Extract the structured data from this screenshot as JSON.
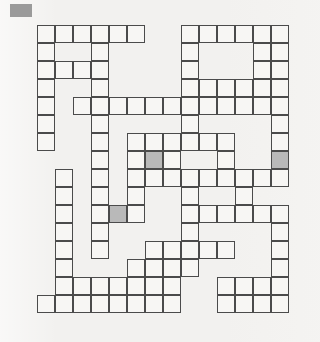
{
  "page": {
    "kind": "crossword-grid-diagram",
    "background_color": "#f2f1ef",
    "width": 320,
    "height": 342
  },
  "corner_swatch": {
    "label": "",
    "color": "#9a9a9a",
    "x": 10,
    "y": 4,
    "width": 22,
    "height": 13
  },
  "grid": {
    "origin_x": 37,
    "origin_y": 25,
    "cell_size": 18,
    "columns": 14,
    "rows": 16,
    "line_color": "#4b4b4b",
    "cell_color": "#f7f6f4",
    "shaded_color": "#b9b9b9",
    "shaded_cells": [
      [
        7,
        6
      ],
      [
        7,
        13
      ],
      [
        10,
        4
      ]
    ],
    "cells": [
      [
        0,
        0
      ],
      [
        0,
        1
      ],
      [
        0,
        2
      ],
      [
        0,
        3
      ],
      [
        0,
        4
      ],
      [
        0,
        5
      ],
      [
        0,
        8
      ],
      [
        0,
        9
      ],
      [
        0,
        10
      ],
      [
        0,
        11
      ],
      [
        0,
        12
      ],
      [
        0,
        13
      ],
      [
        1,
        0
      ],
      [
        1,
        3
      ],
      [
        1,
        8
      ],
      [
        1,
        12
      ],
      [
        1,
        13
      ],
      [
        2,
        0
      ],
      [
        2,
        1
      ],
      [
        2,
        2
      ],
      [
        2,
        3
      ],
      [
        2,
        8
      ],
      [
        2,
        12
      ],
      [
        2,
        13
      ],
      [
        3,
        0
      ],
      [
        3,
        3
      ],
      [
        3,
        8
      ],
      [
        3,
        9
      ],
      [
        3,
        10
      ],
      [
        3,
        11
      ],
      [
        3,
        12
      ],
      [
        3,
        13
      ],
      [
        4,
        0
      ],
      [
        4,
        2
      ],
      [
        4,
        3
      ],
      [
        4,
        4
      ],
      [
        4,
        5
      ],
      [
        4,
        6
      ],
      [
        4,
        7
      ],
      [
        4,
        8
      ],
      [
        4,
        9
      ],
      [
        4,
        10
      ],
      [
        4,
        11
      ],
      [
        4,
        12
      ],
      [
        4,
        13
      ],
      [
        5,
        0
      ],
      [
        5,
        3
      ],
      [
        5,
        8
      ],
      [
        5,
        13
      ],
      [
        6,
        0
      ],
      [
        6,
        3
      ],
      [
        6,
        5
      ],
      [
        6,
        6
      ],
      [
        6,
        7
      ],
      [
        6,
        8
      ],
      [
        6,
        9
      ],
      [
        6,
        10
      ],
      [
        6,
        13
      ],
      [
        7,
        3
      ],
      [
        7,
        5
      ],
      [
        7,
        6
      ],
      [
        7,
        7
      ],
      [
        7,
        10
      ],
      [
        7,
        13
      ],
      [
        8,
        1
      ],
      [
        8,
        3
      ],
      [
        8,
        5
      ],
      [
        8,
        6
      ],
      [
        8,
        7
      ],
      [
        8,
        8
      ],
      [
        8,
        9
      ],
      [
        8,
        10
      ],
      [
        8,
        11
      ],
      [
        8,
        12
      ],
      [
        8,
        13
      ],
      [
        9,
        1
      ],
      [
        9,
        3
      ],
      [
        9,
        5
      ],
      [
        9,
        8
      ],
      [
        9,
        11
      ],
      [
        10,
        1
      ],
      [
        10,
        3
      ],
      [
        10,
        4
      ],
      [
        10,
        5
      ],
      [
        10,
        8
      ],
      [
        10,
        9
      ],
      [
        10,
        10
      ],
      [
        10,
        11
      ],
      [
        10,
        12
      ],
      [
        10,
        13
      ],
      [
        11,
        1
      ],
      [
        11,
        3
      ],
      [
        11,
        8
      ],
      [
        11,
        13
      ],
      [
        12,
        1
      ],
      [
        12,
        3
      ],
      [
        12,
        6
      ],
      [
        12,
        7
      ],
      [
        12,
        8
      ],
      [
        12,
        9
      ],
      [
        12,
        10
      ],
      [
        12,
        13
      ],
      [
        13,
        1
      ],
      [
        13,
        5
      ],
      [
        13,
        6
      ],
      [
        13,
        7
      ],
      [
        13,
        8
      ],
      [
        13,
        13
      ],
      [
        14,
        1
      ],
      [
        14,
        2
      ],
      [
        14,
        3
      ],
      [
        14,
        4
      ],
      [
        14,
        5
      ],
      [
        14,
        6
      ],
      [
        14,
        7
      ],
      [
        14,
        10
      ],
      [
        14,
        11
      ],
      [
        14,
        12
      ],
      [
        14,
        13
      ],
      [
        15,
        0
      ],
      [
        15,
        1
      ],
      [
        15,
        2
      ],
      [
        15,
        3
      ],
      [
        15,
        4
      ],
      [
        15,
        5
      ],
      [
        15,
        6
      ],
      [
        15,
        7
      ],
      [
        15,
        10
      ],
      [
        15,
        11
      ],
      [
        15,
        12
      ],
      [
        15,
        13
      ]
    ]
  }
}
